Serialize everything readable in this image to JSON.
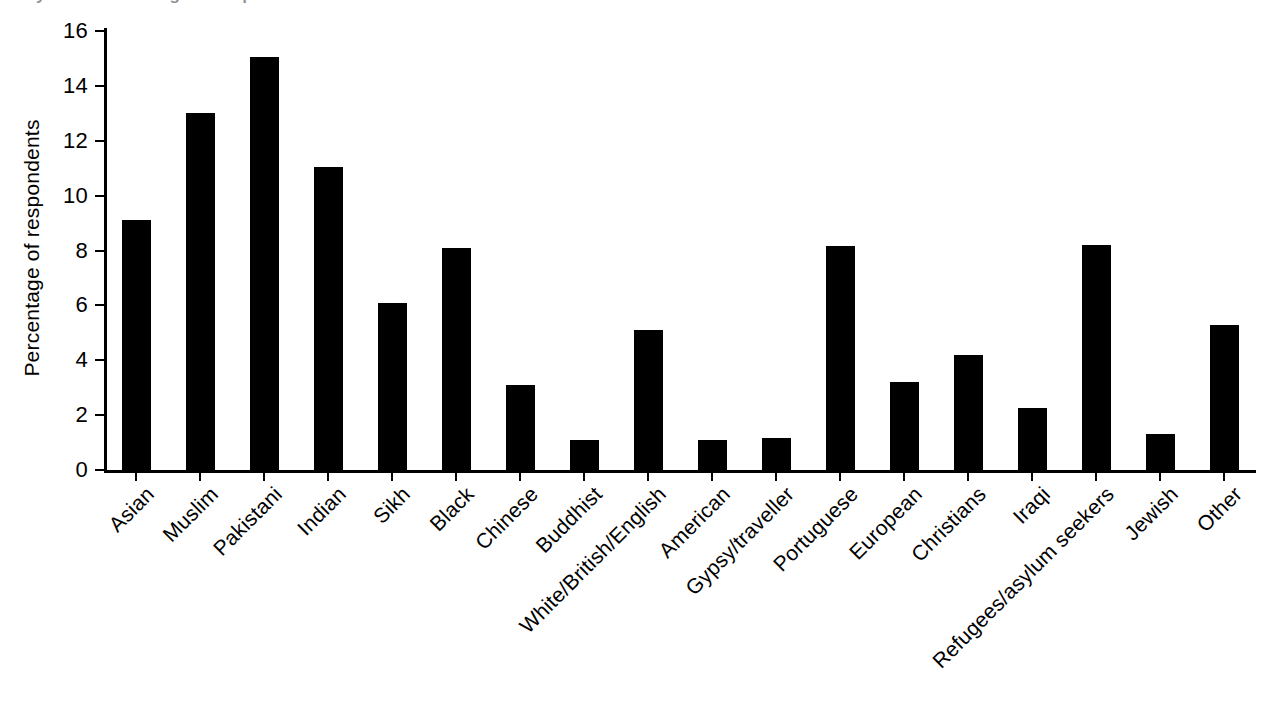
{
  "figure": {
    "cropped_title_fragment": "y-axis: Percentage of respondents",
    "background_color": "#ffffff",
    "bar_color": "#000000",
    "axis_color": "#000000"
  },
  "chart_data": {
    "type": "bar",
    "title": "",
    "xlabel": "",
    "ylabel": "Percentage of respondents",
    "ylim": [
      0,
      16
    ],
    "yticks": [
      0,
      2,
      4,
      6,
      8,
      10,
      12,
      14,
      16
    ],
    "ytick_labels": [
      "0",
      "2",
      "4",
      "6",
      "8",
      "10",
      "12",
      "14",
      "16"
    ],
    "grid": false,
    "legend": null,
    "categories": [
      "Asian",
      "Muslim",
      "Pakistani",
      "Indian",
      "Sikh",
      "Black",
      "Chinese",
      "Buddhist",
      "White/British/English",
      "American",
      "Gypsy/traveller",
      "Portuguese",
      "European",
      "Christians",
      "Iraqi",
      "Refugees/asylum seekers",
      "Jewish",
      "Other"
    ],
    "values": [
      9.1,
      13.0,
      15.05,
      11.05,
      6.1,
      8.1,
      3.1,
      1.1,
      5.1,
      1.1,
      1.15,
      8.15,
      3.2,
      4.2,
      2.25,
      8.2,
      1.3,
      5.3
    ],
    "series": [
      {
        "name": "Percentage of respondents",
        "values": [
          9.1,
          13.0,
          15.05,
          11.05,
          6.1,
          8.1,
          3.1,
          1.1,
          5.1,
          1.1,
          1.15,
          8.15,
          3.2,
          4.2,
          2.25,
          8.2,
          1.3,
          5.3
        ]
      }
    ],
    "label_rotation_degrees": -45
  }
}
